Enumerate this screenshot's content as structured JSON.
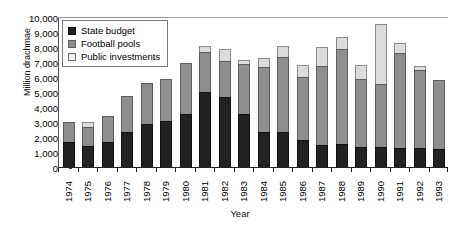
{
  "chart_data": {
    "type": "bar",
    "stacked": true,
    "title": "",
    "xlabel": "Year",
    "ylabel": "Million drachmae",
    "ylim": [
      0,
      10000
    ],
    "ytick_step": 1000,
    "ytick_labels": [
      "10,000",
      "9,000",
      "8,000",
      "7,000",
      "6,000",
      "5,000",
      "4,000",
      "3,000",
      "2,000",
      "1,000",
      "0"
    ],
    "grid": false,
    "legend_position": "top-left inside plot",
    "categories": [
      "1974",
      "1975",
      "1976",
      "1977",
      "1978",
      "1979",
      "1980",
      "1981",
      "1982",
      "1983",
      "1984",
      "1985",
      "1986",
      "1987",
      "1988",
      "1989",
      "1990",
      "1991",
      "1992",
      "1993"
    ],
    "series": [
      {
        "name": "State budget",
        "color": "#222222",
        "values": [
          1650,
          1400,
          1650,
          2350,
          2900,
          3100,
          3550,
          5000,
          4700,
          3550,
          2350,
          2350,
          1800,
          1450,
          1550,
          1350,
          1350,
          1300,
          1250,
          1200
        ]
      },
      {
        "name": "Football pools",
        "color": "#8e8e8e",
        "values": [
          1350,
          1250,
          1750,
          2400,
          2700,
          2800,
          3400,
          2700,
          2400,
          3300,
          4350,
          5000,
          4200,
          5300,
          6300,
          4550,
          4200,
          6300,
          5250,
          4600
        ]
      },
      {
        "name": "Public investments",
        "color": "#dcdcdc",
        "values": [
          0,
          350,
          0,
          0,
          0,
          0,
          0,
          400,
          800,
          300,
          600,
          750,
          800,
          1250,
          800,
          900,
          4000,
          700,
          250,
          0
        ]
      }
    ],
    "totals": [
      3000,
      3000,
      3400,
      4750,
      5600,
      5900,
      6950,
      8100,
      7900,
      7150,
      7300,
      8100,
      6800,
      8000,
      8650,
      6800,
      9550,
      8300,
      6750,
      5800
    ]
  },
  "legend": {
    "items": [
      {
        "label": "State budget",
        "swatch": "legend-swatch-state-budget"
      },
      {
        "label": "Football pools",
        "swatch": "legend-swatch-football-pools"
      },
      {
        "label": "Public investments",
        "swatch": "legend-swatch-public-investments"
      }
    ]
  },
  "axes": {
    "x_title": "Year",
    "y_title": "Million drachmae"
  }
}
